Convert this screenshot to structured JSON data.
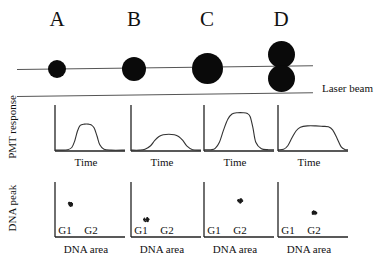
{
  "figure": {
    "type": "scientific-diagram",
    "ink_color": "#0a0a0a",
    "line_color": "#555555"
  },
  "columns": [
    {
      "letter": "A"
    },
    {
      "letter": "B"
    },
    {
      "letter": "C"
    },
    {
      "letter": "D"
    }
  ],
  "laser": {
    "label": "Laser beam"
  },
  "pmt": {
    "y_axis_label": "PMT response",
    "x_axis_label": "Time"
  },
  "dna": {
    "y_axis_label": "DNA peak",
    "x_axis_label": "DNA area",
    "gate_g1": "G1",
    "gate_g2": "G2"
  },
  "chart_data": [
    {
      "type": "line",
      "panel": "A",
      "title": "PMT response A",
      "xlabel": "Time",
      "ylabel": "PMT response",
      "xlim": [
        0,
        100
      ],
      "ylim": [
        0,
        100
      ],
      "grid": false,
      "description": "narrow moderate-height pulse from a single small cell",
      "x": [
        0,
        10,
        18,
        24,
        28,
        32,
        36,
        42,
        48,
        52,
        56,
        60,
        64,
        70,
        80,
        100
      ],
      "y": [
        2,
        2,
        3,
        8,
        22,
        45,
        58,
        61,
        61,
        59,
        52,
        34,
        14,
        4,
        2,
        2
      ]
    },
    {
      "type": "line",
      "panel": "B",
      "title": "PMT response B",
      "xlabel": "Time",
      "ylabel": "PMT response",
      "xlim": [
        0,
        100
      ],
      "ylim": [
        0,
        100
      ],
      "grid": false,
      "description": "low broad pulse from a single larger but dimmer cell",
      "x": [
        0,
        12,
        20,
        28,
        34,
        40,
        46,
        54,
        62,
        68,
        74,
        80,
        88,
        100
      ],
      "y": [
        2,
        2,
        4,
        12,
        24,
        33,
        37,
        38,
        37,
        33,
        24,
        11,
        3,
        2
      ]
    },
    {
      "type": "line",
      "panel": "C",
      "title": "PMT response C",
      "xlabel": "Time",
      "ylabel": "PMT response",
      "xlim": [
        0,
        100
      ],
      "ylim": [
        0,
        100
      ],
      "grid": false,
      "description": "tall pulse with flat top from a single large bright cell",
      "x": [
        0,
        10,
        16,
        22,
        28,
        34,
        40,
        48,
        56,
        62,
        66,
        70,
        74,
        82,
        92,
        100
      ],
      "y": [
        3,
        3,
        6,
        20,
        48,
        72,
        84,
        87,
        87,
        85,
        78,
        52,
        20,
        5,
        3,
        3
      ]
    },
    {
      "type": "line",
      "panel": "D",
      "title": "PMT response D",
      "xlabel": "Time",
      "ylabel": "PMT response",
      "xlim": [
        0,
        100
      ],
      "ylim": [
        0,
        100
      ],
      "grid": false,
      "description": "wide flat-topped pulse from a doublet of two attached cells",
      "x": [
        0,
        8,
        14,
        20,
        26,
        32,
        42,
        54,
        64,
        72,
        78,
        84,
        90,
        96,
        100
      ],
      "y": [
        3,
        4,
        12,
        30,
        46,
        54,
        57,
        57,
        56,
        55,
        48,
        30,
        10,
        3,
        3
      ]
    },
    {
      "type": "scatter",
      "panel": "A",
      "title": "DNA peak vs DNA area A",
      "xlabel": "DNA area",
      "ylabel": "DNA peak",
      "xlim": [
        0,
        100
      ],
      "ylim": [
        0,
        100
      ],
      "grid": false,
      "xticklabels": [
        "G1",
        "G2"
      ],
      "description": "single cluster at G1 DNA area with high DNA peak",
      "points": [
        {
          "x": 22,
          "y": 62,
          "gate": "G1"
        }
      ]
    },
    {
      "type": "scatter",
      "panel": "B",
      "title": "DNA peak vs DNA area B",
      "xlabel": "DNA area",
      "ylabel": "DNA peak",
      "xlim": [
        0,
        100
      ],
      "ylim": [
        0,
        100
      ],
      "grid": false,
      "xticklabels": [
        "G1",
        "G2"
      ],
      "description": "single cluster at G1 DNA area with low DNA peak",
      "points": [
        {
          "x": 22,
          "y": 33,
          "gate": "G1"
        }
      ]
    },
    {
      "type": "scatter",
      "panel": "C",
      "title": "DNA peak vs DNA area C",
      "xlabel": "DNA area",
      "ylabel": "DNA peak",
      "xlim": [
        0,
        100
      ],
      "ylim": [
        0,
        100
      ],
      "grid": false,
      "xticklabels": [
        "G1",
        "G2"
      ],
      "description": "single cluster at G2 DNA area with high DNA peak",
      "points": [
        {
          "x": 52,
          "y": 68,
          "gate": "G2"
        }
      ]
    },
    {
      "type": "scatter",
      "panel": "D",
      "title": "DNA peak vs DNA area D",
      "xlabel": "DNA area",
      "ylabel": "DNA peak",
      "xlim": [
        0,
        100
      ],
      "ylim": [
        0,
        100
      ],
      "grid": false,
      "xticklabels": [
        "G1",
        "G2"
      ],
      "description": "doublet cluster at G2 DNA area with reduced DNA peak",
      "points": [
        {
          "x": 52,
          "y": 45,
          "gate": "G2"
        }
      ]
    }
  ],
  "cells": [
    {
      "panel": "A",
      "kind": "single",
      "bodies": [
        {
          "diameter": 18,
          "cx": 57,
          "cy": 33
        }
      ]
    },
    {
      "panel": "B",
      "kind": "single",
      "bodies": [
        {
          "diameter": 24,
          "cx": 134,
          "cy": 33
        }
      ]
    },
    {
      "panel": "C",
      "kind": "single",
      "bodies": [
        {
          "diameter": 31,
          "cx": 207,
          "cy": 32
        }
      ]
    },
    {
      "panel": "D",
      "kind": "doublet",
      "bodies": [
        {
          "diameter": 27,
          "cx": 281,
          "cy": 18
        },
        {
          "diameter": 27,
          "cx": 281,
          "cy": 42
        }
      ]
    }
  ]
}
